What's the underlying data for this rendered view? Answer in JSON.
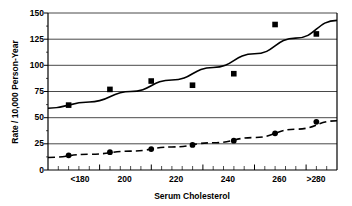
{
  "chart_data": {
    "type": "line",
    "title": "",
    "xlabel": "Serum Cholesterol",
    "ylabel": "Rate / 10,000  Person-Year",
    "xlim": [
      160,
      300
    ],
    "ylim": [
      0,
      150
    ],
    "grid": true,
    "legend": "none",
    "y_ticks": [
      0,
      25,
      50,
      75,
      100,
      125,
      150
    ],
    "y_tick_labels": [
      "0",
      "25",
      "50",
      "75",
      "100",
      "125",
      "150"
    ],
    "x_ticks": [
      180,
      200,
      220,
      240,
      260,
      280
    ],
    "x_tick_labels": [
      "<180",
      "200",
      "220",
      "240",
      "260",
      ">280"
    ],
    "x": [
      170,
      190,
      210,
      230,
      250,
      270,
      290
    ],
    "series": [
      {
        "name": "upper",
        "marker": "square",
        "line_style": "solid",
        "values": [
          62,
          77,
          85,
          81,
          92,
          139,
          130
        ],
        "fit_curve": [
          {
            "x": 160,
            "y": 59
          },
          {
            "x": 180,
            "y": 65
          },
          {
            "x": 200,
            "y": 75
          },
          {
            "x": 220,
            "y": 86
          },
          {
            "x": 240,
            "y": 98
          },
          {
            "x": 260,
            "y": 111
          },
          {
            "x": 280,
            "y": 126
          },
          {
            "x": 300,
            "y": 143
          }
        ]
      },
      {
        "name": "lower",
        "marker": "circle",
        "line_style": "dashed",
        "values": [
          14,
          17,
          20,
          24,
          28,
          35,
          46
        ],
        "fit_curve": [
          {
            "x": 160,
            "y": 12
          },
          {
            "x": 180,
            "y": 15
          },
          {
            "x": 200,
            "y": 18
          },
          {
            "x": 220,
            "y": 22
          },
          {
            "x": 240,
            "y": 26
          },
          {
            "x": 260,
            "y": 31
          },
          {
            "x": 280,
            "y": 39
          },
          {
            "x": 300,
            "y": 47
          }
        ]
      }
    ]
  },
  "figure": {
    "y_axis_title": "Rate / 10,000  Person-Year",
    "x_axis_title": "Serum Cholesterol",
    "y_labels": {
      "t0": "0",
      "t25": "25",
      "t50": "50",
      "t75": "75",
      "t100": "100",
      "t125": "125",
      "t150": "150"
    },
    "x_labels": {
      "t180": "<180",
      "t200": "200",
      "t220": "220",
      "t240": "240",
      "t260": "260",
      "t280": ">280"
    }
  }
}
